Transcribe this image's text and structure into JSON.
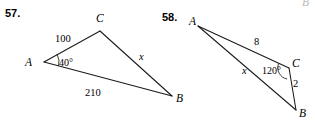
{
  "page": {
    "width": 315,
    "height": 121,
    "background": "#ffffff",
    "ink": "#1a1a1a"
  },
  "problems": [
    {
      "number": "57.",
      "number_pos": {
        "x": 5,
        "y": 17
      },
      "vertices": [
        {
          "name": "A",
          "label": "A",
          "point": {
            "x": 44,
            "y": 62
          },
          "label_pos": {
            "x": 25,
            "y": 66
          }
        },
        {
          "name": "C",
          "label": "C",
          "point": {
            "x": 100,
            "y": 31
          },
          "label_pos": {
            "x": 96,
            "y": 22
          }
        },
        {
          "name": "B",
          "label": "B",
          "point": {
            "x": 172,
            "y": 96
          },
          "label_pos": {
            "x": 176,
            "y": 102
          }
        }
      ],
      "sides": [
        {
          "name": "side-AC",
          "label": "100",
          "italic": false,
          "label_pos": {
            "x": 55,
            "y": 42
          }
        },
        {
          "name": "side-CB",
          "label": "x",
          "italic": true,
          "label_pos": {
            "x": 139,
            "y": 60
          }
        },
        {
          "name": "side-AB",
          "label": "210",
          "italic": false,
          "label_pos": {
            "x": 85,
            "y": 96
          }
        }
      ],
      "angles": [
        {
          "name": "angle-A",
          "label": "40°",
          "label_pos": {
            "x": 59,
            "y": 66
          },
          "at": "A"
        }
      ]
    },
    {
      "number": "58.",
      "number_pos": {
        "x": 162,
        "y": 21
      },
      "vertices": [
        {
          "name": "A",
          "label": "A",
          "point": {
            "x": 198,
            "y": 26
          },
          "label_pos": {
            "x": 189,
            "y": 25
          }
        },
        {
          "name": "C",
          "label": "C",
          "point": {
            "x": 289,
            "y": 68
          },
          "label_pos": {
            "x": 292,
            "y": 67
          }
        },
        {
          "name": "B",
          "label": "B",
          "point": {
            "x": 296,
            "y": 110
          },
          "label_pos": {
            "x": 299,
            "y": 117
          }
        }
      ],
      "sides": [
        {
          "name": "side-AC",
          "label": "8",
          "italic": false,
          "label_pos": {
            "x": 254,
            "y": 45
          }
        },
        {
          "name": "side-AB",
          "label": "x",
          "italic": true,
          "label_pos": {
            "x": 242,
            "y": 74
          }
        },
        {
          "name": "side-CB",
          "label": "2",
          "italic": false,
          "label_pos": {
            "x": 293,
            "y": 87
          }
        }
      ],
      "angles": [
        {
          "name": "angle-C",
          "label": "120°",
          "label_pos": {
            "x": 262,
            "y": 74
          },
          "at": "C"
        }
      ]
    }
  ],
  "artifacts": [
    {
      "name": "clipped-letter-top-right",
      "label": "B",
      "pos": {
        "x": 302,
        "y": 6
      }
    }
  ]
}
